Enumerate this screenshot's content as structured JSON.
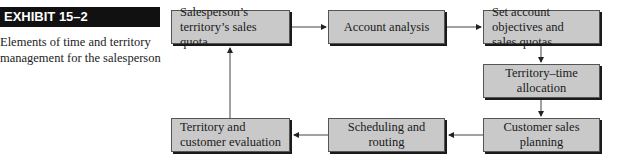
{
  "exhibit": {
    "tag": "EXHIBIT 15–2",
    "caption": "Elements of time and territory management for the salesperson"
  },
  "diagram": {
    "nodes": [
      {
        "id": "quota",
        "label": "Salesperson’s territory’s sales quota"
      },
      {
        "id": "account-analysis",
        "label": "Account analysis"
      },
      {
        "id": "objectives",
        "label": "Set account objectives and sales quotas"
      },
      {
        "id": "allocation",
        "label": "Territory–time allocation"
      },
      {
        "id": "planning",
        "label": "Customer sales planning"
      },
      {
        "id": "scheduling",
        "label": "Scheduling and routing"
      },
      {
        "id": "evaluation",
        "label": "Territory and customer evaluation"
      }
    ],
    "edges": [
      {
        "from": "quota",
        "to": "account-analysis"
      },
      {
        "from": "account-analysis",
        "to": "objectives"
      },
      {
        "from": "objectives",
        "to": "allocation"
      },
      {
        "from": "allocation",
        "to": "planning"
      },
      {
        "from": "planning",
        "to": "scheduling"
      },
      {
        "from": "scheduling",
        "to": "evaluation"
      },
      {
        "from": "evaluation",
        "to": "quota"
      }
    ]
  }
}
